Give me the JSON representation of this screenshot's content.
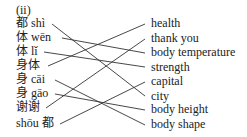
{
  "heading": "(ii)",
  "left_items": [
    {
      "text": "都 shì",
      "y": 17
    },
    {
      "text": "体 wēn",
      "y": 31
    },
    {
      "text": "体 lǐ",
      "y": 45
    },
    {
      "text": "身体",
      "y": 59
    },
    {
      "text": "身 cāi",
      "y": 73
    },
    {
      "text": "身 gāo",
      "y": 87
    },
    {
      "text": "谢谢",
      "y": 101
    },
    {
      "text": "shōu 都",
      "y": 117
    }
  ],
  "right_items": [
    {
      "text": "health",
      "y": 17
    },
    {
      "text": "thank you",
      "y": 32
    },
    {
      "text": "body temperature",
      "y": 46
    },
    {
      "text": "strength",
      "y": 61
    },
    {
      "text": "capital",
      "y": 75
    },
    {
      "text": "city",
      "y": 90
    },
    {
      "text": "body height",
      "y": 103
    },
    {
      "text": "body shape",
      "y": 118
    }
  ],
  "connections": [
    {
      "from": "都 shì",
      "to": "city"
    },
    {
      "from": "体 wēn",
      "to": "body temperature"
    },
    {
      "from": "体 lǐ",
      "to": "strength"
    },
    {
      "from": "身体",
      "to": "health"
    },
    {
      "from": "身 cāi",
      "to": "body shape"
    },
    {
      "from": "身 gāo",
      "to": "body height"
    },
    {
      "from": "谢谢",
      "to": "thank you"
    },
    {
      "from": "shōu 都",
      "to": "capital"
    }
  ]
}
